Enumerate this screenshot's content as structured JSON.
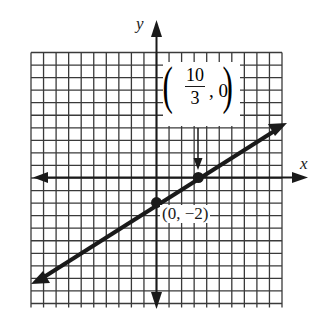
{
  "figure": {
    "x_axis_label": "x",
    "y_axis_label": "y",
    "grid": {
      "cols": 20,
      "rows": 20,
      "unit_px": 12.55
    },
    "line": {
      "equation": "y = (3/5)x - 2",
      "slope": 0.6,
      "intercept": -2,
      "color": "#1a1a1a"
    },
    "points": [
      {
        "label": "(0, −2)",
        "x": 0,
        "y": -2
      },
      {
        "label_numerator": "10",
        "label_denominator": "3",
        "label_rest": ", 0",
        "x": 3.333,
        "y": 0
      }
    ],
    "point_labels": {
      "y_intercept": "(0, −2)",
      "x_intercept_num": "10",
      "x_intercept_den": "3",
      "x_intercept_rest": ", 0"
    }
  }
}
